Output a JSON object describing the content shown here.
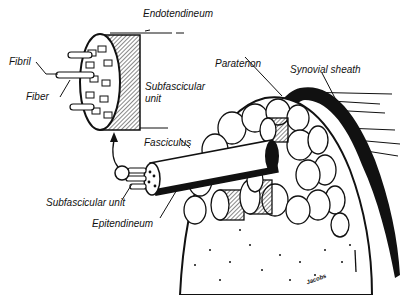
{
  "figure": {
    "colors": {
      "ink": "#111111",
      "paper": "#ffffff",
      "shade": "#9a9a9a"
    },
    "labels": {
      "endotendineum": "Endotendineum",
      "fibril": "Fibril",
      "fiber": "Fiber",
      "subfascicular_unit_top_line1": "Subfascicular",
      "subfascicular_unit_top_line2": "unit",
      "paratenon": "Paratenon",
      "synovial_sheath": "Synovial sheath",
      "fasciculus": "Fasciculus",
      "subfascicular_unit_bottom": "Subfascicular unit",
      "epitendineum": "Epitendineum"
    },
    "signature": "Jacobs"
  }
}
